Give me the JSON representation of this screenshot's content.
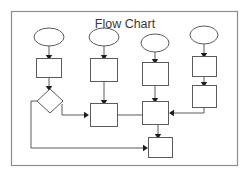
{
  "title": "Flow Chart",
  "canvas": {
    "width": 250,
    "height": 177,
    "background": "#ffffff"
  },
  "frame": {
    "x": 11,
    "y": 11,
    "width": 227,
    "height": 155,
    "stroke": "#8d8d8d"
  },
  "style": {
    "node_fill": "#ffffff",
    "node_stroke": "#5b5b5b",
    "connector_stroke": "#5b5b5b",
    "arrow_fill": "#1d1d1d",
    "title_color": "#3a3a3a"
  },
  "diagram": {
    "type": "flowchart",
    "orientation": "top-to-bottom",
    "columns": 4,
    "nodes": [
      {
        "id": "c1-start",
        "shape": "ellipse",
        "label": "",
        "cx": 49,
        "cy": 37,
        "rx": 15,
        "ry": 9
      },
      {
        "id": "c1-process1",
        "shape": "rectangle",
        "label": "",
        "x": 36,
        "y": 58,
        "width": 26,
        "height": 20
      },
      {
        "id": "c1-decision",
        "shape": "diamond",
        "label": "",
        "cx": 50,
        "cy": 101,
        "rx": 13,
        "ry": 12
      },
      {
        "id": "c2-start",
        "shape": "ellipse",
        "label": "",
        "cx": 104,
        "cy": 37,
        "rx": 15,
        "ry": 9
      },
      {
        "id": "c2-process1",
        "shape": "rectangle",
        "label": "",
        "x": 90,
        "y": 58,
        "width": 28,
        "height": 24
      },
      {
        "id": "c2-process2",
        "shape": "rectangle",
        "label": "",
        "x": 90,
        "y": 103,
        "width": 28,
        "height": 24
      },
      {
        "id": "c3-start",
        "shape": "ellipse",
        "label": "",
        "cx": 155,
        "cy": 43,
        "rx": 14,
        "ry": 9
      },
      {
        "id": "c3-process1",
        "shape": "rectangle",
        "label": "",
        "x": 142,
        "y": 62,
        "width": 27,
        "height": 24
      },
      {
        "id": "c3-junction",
        "shape": "rectangle",
        "label": "",
        "x": 142,
        "y": 101,
        "width": 27,
        "height": 24
      },
      {
        "id": "c3-end",
        "shape": "rectangle",
        "label": "",
        "x": 148,
        "y": 137,
        "width": 25,
        "height": 21
      },
      {
        "id": "c4-start",
        "shape": "ellipse",
        "label": "",
        "cx": 204,
        "cy": 35,
        "rx": 14,
        "ry": 9
      },
      {
        "id": "c4-process1",
        "shape": "rectangle",
        "label": "",
        "x": 192,
        "y": 56,
        "width": 25,
        "height": 21
      },
      {
        "id": "c4-process2",
        "shape": "rectangle",
        "label": "",
        "x": 192,
        "y": 85,
        "width": 25,
        "height": 23
      }
    ],
    "edges": [
      {
        "id": "e1",
        "from": "c1-start",
        "to": "c1-process1",
        "path": "M49,46 L49,56",
        "arrow": "down"
      },
      {
        "id": "e2",
        "from": "c1-process1",
        "to": "c1-decision",
        "path": "M49,78 L49,87",
        "arrow": "down"
      },
      {
        "id": "e3",
        "from": "c1-decision",
        "to": "c2-process2",
        "path": "M63,101 L63,115 L86,115",
        "arrow": "right"
      },
      {
        "id": "e4",
        "from": "c1-decision",
        "to": "c3-end",
        "path": "M37,101 L31,101 L31,148 L144,148",
        "arrow": "right"
      },
      {
        "id": "e5",
        "from": "c2-start",
        "to": "c2-process1",
        "path": "M104,46 L104,56",
        "arrow": "down"
      },
      {
        "id": "e6",
        "from": "c2-process1",
        "to": "c2-process2",
        "path": "M104,82 L104,101",
        "arrow": "down"
      },
      {
        "id": "e7",
        "from": "c2-process2",
        "to": "c3-junction",
        "path": "M118,115 L142,115",
        "arrow": "none"
      },
      {
        "id": "e8",
        "from": "c3-start",
        "to": "c3-process1",
        "path": "M155,52 L155,60",
        "arrow": "down"
      },
      {
        "id": "e9",
        "from": "c3-process1",
        "to": "c3-junction",
        "path": "M155,86 L155,99",
        "arrow": "down"
      },
      {
        "id": "e10",
        "from": "c3-junction",
        "to": "c3-end",
        "path": "M158,125 L158,135",
        "arrow": "down"
      },
      {
        "id": "e11",
        "from": "c4-start",
        "to": "c4-process1",
        "path": "M204,44 L204,54",
        "arrow": "down"
      },
      {
        "id": "e12",
        "from": "c4-process1",
        "to": "c4-process2",
        "path": "M204,77 L204,83",
        "arrow": "down"
      },
      {
        "id": "e13",
        "from": "c4-process2",
        "to": "c3-junction",
        "path": "M204,108 L204,113 L173,113",
        "arrow": "left"
      }
    ]
  }
}
